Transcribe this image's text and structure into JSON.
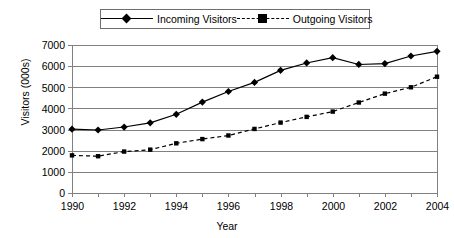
{
  "chart_data": {
    "type": "line",
    "title": "",
    "subtitle": "",
    "xlabel": "Year",
    "ylabel": "Visitors (000s)",
    "x": [
      1990,
      1991,
      1992,
      1993,
      1994,
      1995,
      1996,
      1997,
      1998,
      1999,
      2000,
      2001,
      2002,
      2003,
      2004
    ],
    "categories": [
      "1990",
      "1991",
      "1992",
      "1993",
      "1994",
      "1995",
      "1996",
      "1997",
      "1998",
      "1999",
      "2000",
      "2001",
      "2002",
      "2003",
      "2004"
    ],
    "xtick_labels": [
      "1990",
      "",
      "1992",
      "",
      "1994",
      "",
      "1996",
      "",
      "1998",
      "",
      "2000",
      "",
      "2002",
      "",
      "2004"
    ],
    "ytick_labels": [
      "0",
      "1000",
      "2000",
      "3000",
      "4000",
      "5000",
      "6000",
      "7000"
    ],
    "ytick_values": [
      0,
      1000,
      2000,
      3000,
      4000,
      5000,
      6000,
      7000
    ],
    "xlim": [
      1990,
      2004
    ],
    "ylim": [
      0,
      7000
    ],
    "grid": "horizontal",
    "legend_position": "top-center",
    "series": [
      {
        "name": "Incoming Visitors",
        "marker": "diamond",
        "linestyle": "solid",
        "color": "#000000",
        "values": [
          3020,
          2980,
          3120,
          3320,
          3720,
          4300,
          4800,
          5230,
          5800,
          6150,
          6400,
          6080,
          6120,
          6480,
          6700
        ]
      },
      {
        "name": "Outgoing Visitors",
        "marker": "square",
        "linestyle": "dashed",
        "color": "#000000",
        "values": [
          1780,
          1740,
          1960,
          2050,
          2350,
          2550,
          2720,
          3030,
          3330,
          3600,
          3850,
          4280,
          4700,
          5000,
          5500
        ]
      }
    ]
  },
  "legend": {
    "items": [
      {
        "label": "Incoming Visitors",
        "marker": "diamond-marker",
        "line": "solid-line"
      },
      {
        "label": "Outgoing Visitors",
        "marker": "square-marker",
        "line": "dashed-line"
      }
    ]
  },
  "axes": {
    "y_title": "Visitors (000s)",
    "x_title": "Year"
  },
  "colors": {
    "series": "#000000",
    "grid": "#808080",
    "axis": "#808080",
    "background": "#ffffff",
    "legend_border": "#6e6e6e"
  }
}
